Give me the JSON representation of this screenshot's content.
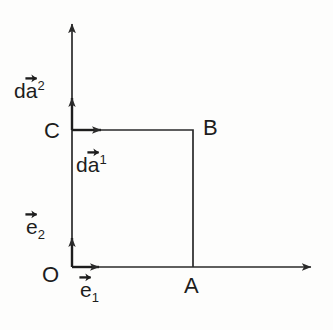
{
  "figure": {
    "background_color": "#fdfdfc",
    "stroke_color": "#2a2a2a",
    "text_color": "#1d1d1d"
  },
  "axes": {
    "x_axis": {
      "name": "horizontal-axis",
      "from": [
        72,
        267
      ],
      "to": [
        318,
        267
      ],
      "arrowhead": "right"
    },
    "y_axis": {
      "name": "vertical-axis",
      "from": [
        72,
        267
      ],
      "to": [
        72,
        17
      ],
      "arrowhead": "up"
    }
  },
  "points": {
    "origin": {
      "label": "O",
      "x": 72,
      "y": 267
    },
    "a": {
      "label": "A",
      "x": 193,
      "y": 267
    },
    "b": {
      "label": "B",
      "x": 193,
      "y": 130
    },
    "c": {
      "label": "C",
      "x": 72,
      "y": 130
    }
  },
  "rectangle": {
    "name": "area-element-OABC",
    "top_left": [
      72,
      130
    ],
    "bottom_right": [
      193,
      267
    ],
    "width": 121,
    "height": 137
  },
  "vectors": [
    {
      "id": "da2",
      "label_base": "da",
      "label_letter": "d",
      "vector_letter": "a",
      "index": "2",
      "index_type": "superscript",
      "display": "dā²",
      "from": [
        72,
        130
      ],
      "to": [
        72,
        92
      ],
      "direction": "up",
      "anchor_point": "C",
      "description": "differential area vector 2, upward along vertical axis from C"
    },
    {
      "id": "da1",
      "label_base": "da",
      "label_letter": "d",
      "vector_letter": "a",
      "index": "1",
      "index_type": "superscript",
      "display": "dā¹",
      "from": [
        72,
        130
      ],
      "to": [
        110,
        130
      ],
      "direction": "right",
      "anchor_point": "C",
      "description": "differential area vector 1, rightward from C along top edge"
    },
    {
      "id": "e2",
      "label_base": "e",
      "label_letter": "",
      "vector_letter": "e",
      "index": "2",
      "index_type": "subscript",
      "display": "ē₂",
      "from": [
        72,
        267
      ],
      "to": [
        72,
        230
      ],
      "direction": "up",
      "anchor_point": "O",
      "description": "basis vector e2, upward from origin"
    },
    {
      "id": "e1",
      "label_base": "e",
      "label_letter": "",
      "vector_letter": "e",
      "index": "1",
      "index_type": "subscript",
      "display": "ē₁",
      "from": [
        72,
        267
      ],
      "to": [
        108,
        267
      ],
      "direction": "right",
      "anchor_point": "O",
      "description": "basis vector e1, rightward from origin"
    }
  ],
  "labels": {
    "da2": {
      "letter": "d",
      "vec": "a",
      "index": "2"
    },
    "da1": {
      "letter": "d",
      "vec": "a",
      "index": "1"
    },
    "e2": {
      "vec": "e",
      "index": "2"
    },
    "e1": {
      "vec": "e",
      "index": "1"
    },
    "point_o": "O",
    "point_a": "A",
    "point_b": "B",
    "point_c": "C"
  }
}
